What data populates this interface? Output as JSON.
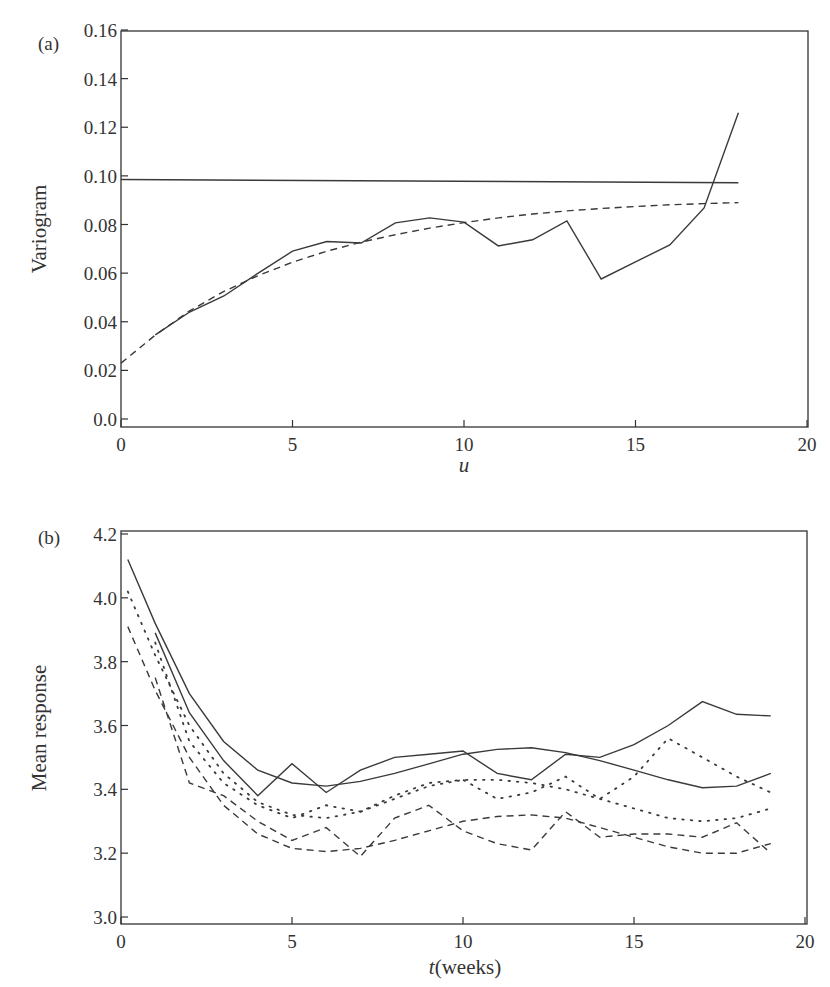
{
  "chart_data": [
    {
      "panel": "(a)",
      "type": "line",
      "xlabel": "u",
      "ylabel": "Variogram",
      "xlim": [
        0,
        20
      ],
      "ylim": [
        0.0,
        0.16
      ],
      "xticks": [
        0,
        5,
        10,
        15,
        20
      ],
      "yticks": [
        0.0,
        0.02,
        0.04,
        0.06,
        0.08,
        0.1,
        0.12,
        0.14,
        0.16
      ],
      "ytick_labels": [
        "0.0",
        "0.02",
        "0.04",
        "0.06",
        "0.08",
        "0.10",
        "0.12",
        "0.14",
        "0.16"
      ],
      "grid": false,
      "series": [
        {
          "name": "Sample variogram",
          "style": "solid",
          "x": [
            1,
            2,
            3,
            4,
            5,
            6,
            7,
            8,
            9,
            10,
            11,
            12,
            13,
            14,
            15,
            16,
            17,
            18
          ],
          "values": [
            0.0346,
            0.044,
            0.0506,
            0.06,
            0.069,
            0.073,
            0.0724,
            0.0807,
            0.0827,
            0.081,
            0.0712,
            0.0737,
            0.0815,
            0.0576,
            0.0646,
            0.0716,
            0.0868,
            0.126
          ]
        },
        {
          "name": "Process variance",
          "style": "solid",
          "x": [
            0,
            18
          ],
          "values": [
            0.0985,
            0.0972
          ]
        },
        {
          "name": "Fitted variogram",
          "style": "dashed",
          "x": [
            0,
            1,
            2,
            3,
            4,
            5,
            6,
            7,
            8,
            9,
            10,
            11,
            12,
            13,
            14,
            15,
            16,
            17,
            18
          ],
          "values": [
            0.023,
            0.0345,
            0.0445,
            0.0525,
            0.059,
            0.0645,
            0.069,
            0.0727,
            0.0758,
            0.0785,
            0.0808,
            0.0827,
            0.0843,
            0.0856,
            0.0866,
            0.0874,
            0.0881,
            0.0886,
            0.089
          ]
        }
      ]
    },
    {
      "panel": "(b)",
      "type": "line",
      "xlabel": "t(weeks)",
      "ylabel": "Mean response",
      "xlim": [
        0,
        20
      ],
      "ylim": [
        3.0,
        4.2
      ],
      "xticks": [
        0,
        5,
        10,
        15,
        20
      ],
      "yticks": [
        3.0,
        3.2,
        3.4,
        3.6,
        3.8,
        4.0,
        4.2
      ],
      "ytick_labels": [
        "3.0",
        "3.2",
        "3.4",
        "3.6",
        "3.8",
        "4.0",
        "4.2"
      ],
      "grid": false,
      "series": [
        {
          "name": "Group 1 observed means",
          "style": "solid",
          "x": [
            1,
            2,
            3,
            4,
            5,
            6,
            7,
            8,
            9,
            10,
            11,
            12,
            13,
            14,
            15,
            16,
            17,
            18,
            19
          ],
          "values": [
            3.89,
            3.64,
            3.49,
            3.38,
            3.48,
            3.39,
            3.46,
            3.5,
            3.51,
            3.52,
            3.45,
            3.43,
            3.51,
            3.5,
            3.54,
            3.6,
            3.675,
            3.635,
            3.63
          ]
        },
        {
          "name": "Group 1 fitted",
          "style": "solid",
          "x": [
            0.2,
            1,
            2,
            3,
            4,
            5,
            6,
            7,
            8,
            9,
            10,
            11,
            12,
            13,
            14,
            15,
            16,
            17,
            18,
            19
          ],
          "values": [
            4.12,
            3.92,
            3.7,
            3.55,
            3.46,
            3.42,
            3.41,
            3.425,
            3.45,
            3.48,
            3.51,
            3.525,
            3.53,
            3.515,
            3.49,
            3.46,
            3.43,
            3.405,
            3.41,
            3.45
          ]
        },
        {
          "name": "Group 2 observed means",
          "style": "dotted",
          "x": [
            1,
            2,
            3,
            4,
            5,
            6,
            7,
            8,
            9,
            10,
            11,
            12,
            13,
            14,
            15,
            16,
            17,
            18,
            19
          ],
          "values": [
            3.86,
            3.55,
            3.42,
            3.35,
            3.31,
            3.35,
            3.33,
            3.38,
            3.42,
            3.43,
            3.37,
            3.39,
            3.44,
            3.37,
            3.44,
            3.56,
            3.5,
            3.44,
            3.39
          ]
        },
        {
          "name": "Group 2 fitted",
          "style": "dotted",
          "x": [
            0.2,
            1,
            2,
            3,
            4,
            5,
            6,
            7,
            8,
            9,
            10,
            11,
            12,
            13,
            14,
            15,
            16,
            17,
            18,
            19
          ],
          "values": [
            4.02,
            3.82,
            3.6,
            3.45,
            3.36,
            3.32,
            3.31,
            3.33,
            3.37,
            3.41,
            3.43,
            3.43,
            3.42,
            3.4,
            3.37,
            3.34,
            3.31,
            3.3,
            3.31,
            3.34
          ]
        },
        {
          "name": "Group 3 observed means",
          "style": "dashed",
          "x": [
            1,
            2,
            3,
            4,
            5,
            6,
            7,
            8,
            9,
            10,
            11,
            12,
            13,
            14,
            15,
            16,
            17,
            18,
            19
          ],
          "values": [
            3.75,
            3.42,
            3.38,
            3.3,
            3.24,
            3.28,
            3.19,
            3.31,
            3.35,
            3.27,
            3.23,
            3.21,
            3.33,
            3.25,
            3.26,
            3.26,
            3.25,
            3.295,
            3.2
          ]
        },
        {
          "name": "Group 3 fitted",
          "style": "dashed",
          "x": [
            0.2,
            1,
            2,
            3,
            4,
            5,
            6,
            7,
            8,
            9,
            10,
            11,
            12,
            13,
            14,
            15,
            16,
            17,
            18,
            19
          ],
          "values": [
            3.91,
            3.71,
            3.5,
            3.35,
            3.26,
            3.215,
            3.205,
            3.215,
            3.24,
            3.27,
            3.3,
            3.315,
            3.32,
            3.31,
            3.28,
            3.25,
            3.22,
            3.2,
            3.2,
            3.23
          ]
        }
      ]
    }
  ]
}
